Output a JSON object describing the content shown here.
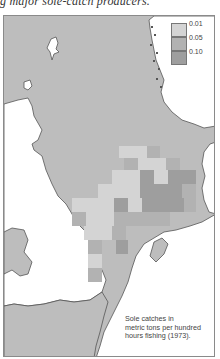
{
  "header": {
    "caption_fragment": "g major sole-catch producers."
  },
  "map": {
    "title": "Sole catches in metric tons per hundred hours fishing (1973).",
    "caption_lines": [
      "Sole catches in",
      "metric tons per hundred",
      "hours fishing (1973)."
    ],
    "colors": {
      "sea": "#bdbdbd",
      "land": "#ffffff",
      "coast": "#555555",
      "class_1": "#d4d4d4",
      "class_2": "#b2b2b2",
      "class_3": "#9e9e9e"
    },
    "legend": [
      {
        "label": "0.01",
        "color": "#d4d4d4"
      },
      {
        "label": "0.05",
        "color": "#b2b2b2"
      },
      {
        "label": "0.10",
        "color": "#9e9e9e"
      }
    ]
  }
}
